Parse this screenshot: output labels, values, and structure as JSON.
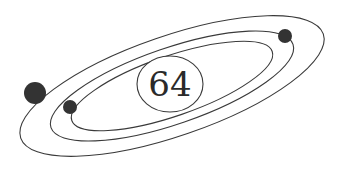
{
  "diagram": {
    "type": "atom-model",
    "nucleus": {
      "label": "64"
    },
    "orbits": [
      {
        "name": "inner",
        "electrons": 1
      },
      {
        "name": "middle",
        "electrons": 1
      },
      {
        "name": "outer",
        "electrons": 1
      }
    ],
    "colors": {
      "stroke": "#3a3a3a",
      "electron": "#333333",
      "background": "#ffffff"
    }
  }
}
